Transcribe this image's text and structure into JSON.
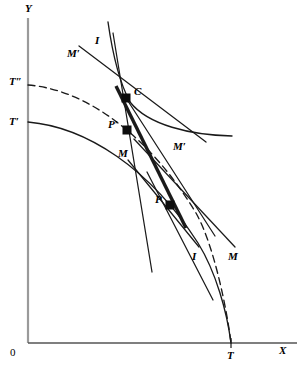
{
  "figure": {
    "background": "#ffffff",
    "ink": "#1a1a1a",
    "width": 302,
    "height": 375
  },
  "axes": {
    "y_label": "Y",
    "x_label": "X",
    "origin_label": "0",
    "x_axis": {
      "y": 343,
      "x_start": 28,
      "x_end": 297
    },
    "y_axis": {
      "x": 28,
      "y_start": 18,
      "y_end": 343
    }
  },
  "tick_labels": [
    {
      "name": "t-double-prime",
      "text": "T″",
      "x": 9,
      "y": 76
    },
    {
      "name": "t-prime",
      "text": "T′",
      "x": 9,
      "y": 116
    },
    {
      "name": "t-axis",
      "text": "T",
      "x": 227,
      "y": 350
    }
  ],
  "points": [
    {
      "name": "point-c",
      "label": "C",
      "x": 126,
      "y": 98,
      "label_dx": 8,
      "label_dy": -12
    },
    {
      "name": "point-p-prime",
      "label": "P′",
      "x": 127,
      "y": 130,
      "label_dx": -19,
      "label_dy": -11
    },
    {
      "name": "point-p",
      "label": "P",
      "x": 170,
      "y": 205,
      "label_dx": -15,
      "label_dy": -11
    }
  ],
  "curve_labels": [
    {
      "name": "label-i-upper",
      "text": "I",
      "x": 95,
      "y": 35
    },
    {
      "name": "label-m-prime-upper",
      "text": "M′",
      "x": 67,
      "y": 48
    },
    {
      "name": "label-m-prime-right",
      "text": "M′",
      "x": 173,
      "y": 141
    },
    {
      "name": "label-m-middle",
      "text": "M",
      "x": 118,
      "y": 148
    },
    {
      "name": "label-i-lower",
      "text": "I",
      "x": 192,
      "y": 251
    },
    {
      "name": "label-m-lower",
      "text": "M",
      "x": 228,
      "y": 251
    }
  ],
  "chart_data": {
    "type": "line",
    "xlabel": "X",
    "ylabel": "Y",
    "series": [
      {
        "name": "ppf-T-prime-solid",
        "style": "solid",
        "path": "M 28 122 C 86 127 150 168 198 243 C 216 272 227 312 231 343"
      },
      {
        "name": "ppf-T-double-prime-dashed",
        "style": "dashed",
        "path": "M 28 85 C 90 90 152 140 196 213 C 214 245 227 310 231 343"
      },
      {
        "name": "indifference-curve-I-through-C",
        "style": "solid",
        "path": "M 108 22 C 112 50 118 80 130 102 C 148 125 190 135 232 136"
      },
      {
        "name": "terms-of-trade-line-thick",
        "style": "thick-solid",
        "path": "M 116 86 L 186 228"
      },
      {
        "name": "budget-line-through-C-down-right",
        "style": "solid",
        "path": "M 126 98 L 215 236"
      },
      {
        "name": "tangent-M-prime-at-C",
        "style": "solid",
        "path": "M 79 46 L 206 142"
      },
      {
        "name": "tangent-M-at-C-steep",
        "style": "solid",
        "path": "M 113 33 L 152 272"
      },
      {
        "name": "tangent-I-at-P-lower",
        "style": "solid",
        "path": "M 128 160 L 199 247"
      },
      {
        "name": "tangent-M-at-P",
        "style": "solid",
        "path": "M 134 139 L 235 247"
      },
      {
        "name": "line-through-P-to-lower-right",
        "style": "solid",
        "path": "M 147 172 L 213 300"
      }
    ]
  }
}
